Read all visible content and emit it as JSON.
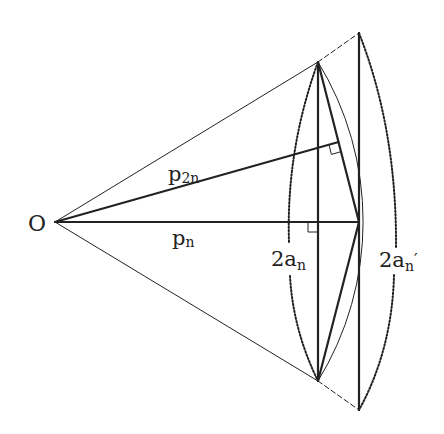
{
  "diagram": {
    "colors": {
      "stroke": "#222222",
      "background": "#ffffff"
    },
    "points": {
      "O": [
        55,
        222
      ],
      "A": [
        318,
        62
      ],
      "B": [
        318,
        381
      ],
      "M": [
        359,
        222
      ],
      "F": [
        318,
        222
      ],
      "T_top": [
        359,
        33
      ],
      "T_bottom": [
        359,
        410
      ],
      "H": [
        338.5,
        142
      ]
    },
    "labels": {
      "origin": "O",
      "p2n_main": "p",
      "p2n_sub": "2n",
      "pn_main": "p",
      "pn_sub": "n",
      "an_coef": "2a",
      "an_sub": "n",
      "an_prime_coef": "2a",
      "an_prime_sub": "n",
      "an_prime_mark": "′"
    }
  }
}
